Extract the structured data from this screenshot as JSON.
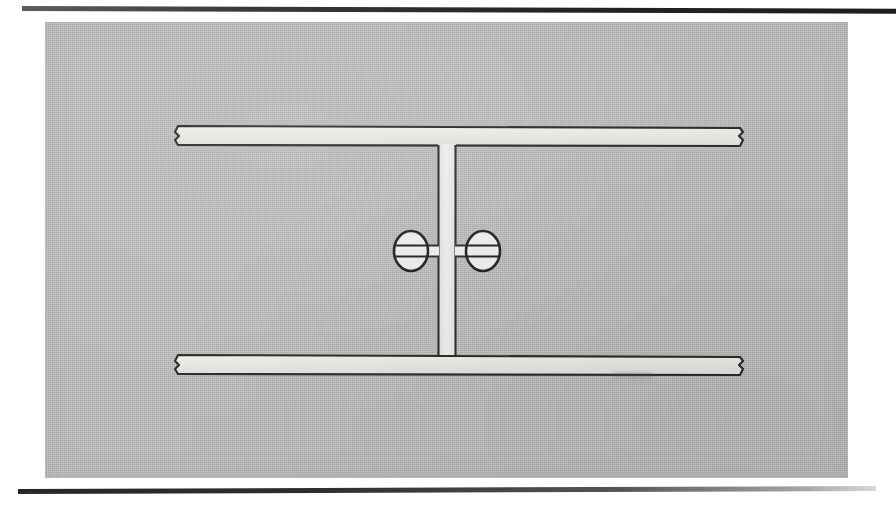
{
  "document": {
    "kind": "scanned-engineering-drawing",
    "subject": "I-beam (wide-flange) cross-section with weld symbols",
    "caption": ""
  },
  "page": {
    "background_color": "#ffffff",
    "width": 896,
    "height": 508
  },
  "rules": {
    "top": {
      "name": "top-rule",
      "color": "#2c2c2c"
    },
    "bottom": {
      "name": "bottom-rule",
      "color": "#2c2c2c"
    }
  },
  "panel": {
    "background_color": "#bdbdbd",
    "border_color": "#bdbdbd"
  },
  "drawing": {
    "line_color": "#2a2a2a",
    "fill_color": "#e8e8e4",
    "components": [
      {
        "id": "top-flange",
        "label": "top flange",
        "x": 130,
        "y": 104,
        "width": 565,
        "height": 20,
        "break_ends": [
          "left",
          "right"
        ]
      },
      {
        "id": "bottom-flange",
        "label": "bottom flange",
        "x": 130,
        "y": 333,
        "width": 565,
        "height": 20,
        "break_ends": [
          "left",
          "right"
        ]
      },
      {
        "id": "web",
        "label": "web",
        "x": 393,
        "y": 124,
        "width": 18,
        "height": 209
      }
    ],
    "symbols": [
      {
        "id": "weld-symbol-left",
        "label": "weld symbol (far side)",
        "type": "circle-with-bars",
        "cx": 366,
        "cy": 229,
        "rx": 17,
        "ry": 20,
        "leader_side": "right",
        "bar_count": 2
      },
      {
        "id": "weld-symbol-right",
        "label": "weld symbol (near side)",
        "type": "circle-with-bars",
        "cx": 438,
        "cy": 229,
        "rx": 17,
        "ry": 20,
        "leader_side": "left",
        "bar_count": 2
      }
    ]
  }
}
